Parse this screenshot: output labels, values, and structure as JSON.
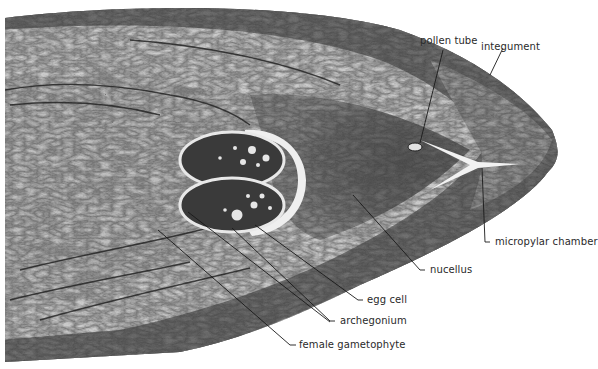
{
  "figure": {
    "type": "light micrograph (longitudinal section of ovule)",
    "colors": {
      "background": "#ffffff",
      "tissue_dark": "#2e2e2e",
      "tissue_mid": "#6e6e6e",
      "tissue_light": "#cfcfcf",
      "label_text": "#2a2a2a",
      "leader_line": "#1a1a1a"
    }
  },
  "labels": {
    "pollen_tube": "pollen tube",
    "integument": "integument",
    "micropylar_chamber": "micropylar chamber",
    "nucellus": "nucellus",
    "egg_cell": "egg cell",
    "archegonium": "archegonium",
    "female_gametophyte": "female gametophyte"
  }
}
